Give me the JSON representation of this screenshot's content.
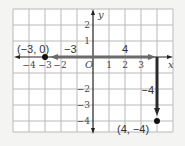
{
  "diagram": {
    "type": "coordinate-plane",
    "x_axis_label": "x",
    "y_axis_label": "y",
    "origin_label": "O",
    "x_ticks": [
      "−4",
      "−3",
      "−2",
      "1",
      "2",
      "3"
    ],
    "y_ticks": [
      "2",
      "1",
      "−2",
      "−3",
      "−4"
    ],
    "points": [
      {
        "label": "(−3, 0)",
        "x": -3,
        "y": 0
      },
      {
        "label": "(4, −4)",
        "x": 4,
        "y": -4
      }
    ],
    "segments": [
      {
        "label": "−3",
        "from": [
          0,
          0
        ],
        "to": [
          -3,
          0
        ]
      },
      {
        "label": "4",
        "from": [
          0,
          0
        ],
        "to": [
          4,
          0
        ]
      },
      {
        "label": "−4",
        "from": [
          4,
          0
        ],
        "to": [
          4,
          -4
        ]
      }
    ],
    "colors": {
      "grid": "#b9b9b9",
      "axis": "#222222",
      "path": "#6b6b6b",
      "vertical_path": "#2a2a2a",
      "background": "#ffffff"
    }
  }
}
